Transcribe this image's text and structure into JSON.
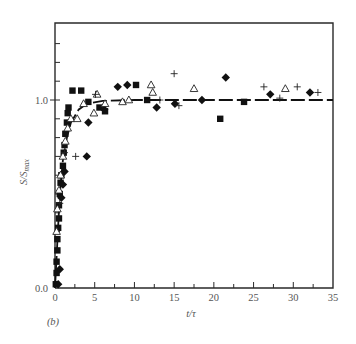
{
  "chart_data": {
    "type": "scatter",
    "title": "",
    "panel_label": "(b)",
    "xlabel": "t/τ",
    "ylabel": "S/S",
    "ylabel_sub": "max",
    "xlim": [
      0,
      35
    ],
    "ylim": [
      0,
      1.4
    ],
    "x_ticks": [
      0,
      5,
      10,
      15,
      20,
      25,
      30,
      35
    ],
    "x_tick_labels": [
      "0",
      "5",
      "10",
      "15",
      "20",
      "25",
      "30",
      "35"
    ],
    "x_minor_ticks": [
      2.5,
      7.5,
      12.5,
      17.5,
      22.5,
      27.5,
      32.5
    ],
    "y_ticks": [
      0.1,
      0.2,
      0.3,
      0.4,
      0.5,
      0.6,
      0.7,
      0.8,
      0.9,
      1.1,
      1.2,
      1.3
    ],
    "y_labeled_ticks": [
      0.0,
      1.0
    ],
    "y_tick_labels": [
      "0.0",
      "1.0"
    ],
    "grid": false,
    "legend": "none",
    "fit_curve": {
      "style": "dashed",
      "description": "saturating curve rising steeply from 0 and levelling at 1.0",
      "points": [
        [
          0,
          0
        ],
        [
          0.3,
          0.25
        ],
        [
          0.6,
          0.5
        ],
        [
          1.0,
          0.68
        ],
        [
          1.5,
          0.8
        ],
        [
          2,
          0.88
        ],
        [
          3,
          0.95
        ],
        [
          4,
          0.98
        ],
        [
          6,
          0.995
        ],
        [
          10,
          1.0
        ],
        [
          35,
          1.0
        ]
      ]
    },
    "series": [
      {
        "name": "filled squares",
        "marker": "square-filled",
        "points": [
          [
            0.1,
            0.02
          ],
          [
            0.2,
            0.08
          ],
          [
            0.2,
            0.14
          ],
          [
            0.3,
            0.2
          ],
          [
            0.3,
            0.26
          ],
          [
            0.4,
            0.32
          ],
          [
            0.5,
            0.37
          ],
          [
            0.5,
            0.44
          ],
          [
            0.6,
            0.5
          ],
          [
            0.7,
            0.56
          ],
          [
            0.8,
            0.6
          ],
          [
            1.0,
            0.65
          ],
          [
            1.1,
            0.72
          ],
          [
            1.2,
            0.76
          ],
          [
            1.3,
            0.82
          ],
          [
            1.5,
            0.88
          ],
          [
            1.6,
            0.93
          ],
          [
            1.7,
            0.96
          ],
          [
            2.2,
            1.05
          ],
          [
            3.3,
            1.05
          ],
          [
            4.2,
            0.99
          ],
          [
            5.6,
            0.96
          ],
          [
            6.3,
            0.94
          ],
          [
            10.2,
            1.08
          ],
          [
            11.6,
            1.0
          ],
          [
            20.8,
            0.9
          ],
          [
            23.8,
            0.99
          ]
        ]
      },
      {
        "name": "filled diamonds",
        "marker": "diamond-filled",
        "points": [
          [
            0.4,
            0.02
          ],
          [
            0.6,
            0.1
          ],
          [
            0.8,
            0.48
          ],
          [
            1.0,
            0.55
          ],
          [
            1.2,
            0.62
          ],
          [
            4.0,
            0.7
          ],
          [
            4.2,
            0.88
          ],
          [
            6.2,
            0.95
          ],
          [
            7.9,
            1.07
          ],
          [
            9.1,
            1.08
          ],
          [
            12.8,
            0.96
          ],
          [
            15.1,
            0.98
          ],
          [
            18.5,
            1.0
          ],
          [
            21.5,
            1.12
          ],
          [
            27.1,
            1.03
          ],
          [
            32.1,
            1.04
          ]
        ]
      },
      {
        "name": "open triangles",
        "marker": "triangle-open",
        "points": [
          [
            0.2,
            0.3
          ],
          [
            0.3,
            0.42
          ],
          [
            0.5,
            0.52
          ],
          [
            0.7,
            0.6
          ],
          [
            1.0,
            0.7
          ],
          [
            1.3,
            0.78
          ],
          [
            1.6,
            0.85
          ],
          [
            2.0,
            0.9
          ],
          [
            2.8,
            0.9
          ],
          [
            3.6,
            0.98
          ],
          [
            4.9,
            0.93
          ],
          [
            5.3,
            1.03
          ],
          [
            6.3,
            0.98
          ],
          [
            8.5,
            0.99
          ],
          [
            9.3,
            1.0
          ],
          [
            12.1,
            1.08
          ],
          [
            12.3,
            1.04
          ],
          [
            17.5,
            1.06
          ],
          [
            29.0,
            1.06
          ]
        ]
      },
      {
        "name": "crosses",
        "marker": "plus",
        "points": [
          [
            0.6,
            0.45
          ],
          [
            1.2,
            0.72
          ],
          [
            2.6,
            0.7
          ],
          [
            5.1,
            1.03
          ],
          [
            13.2,
            1.0
          ],
          [
            15.0,
            1.14
          ],
          [
            15.6,
            0.97
          ],
          [
            26.3,
            1.07
          ],
          [
            28.3,
            1.01
          ],
          [
            30.5,
            1.07
          ],
          [
            33.1,
            1.04
          ]
        ]
      }
    ]
  }
}
